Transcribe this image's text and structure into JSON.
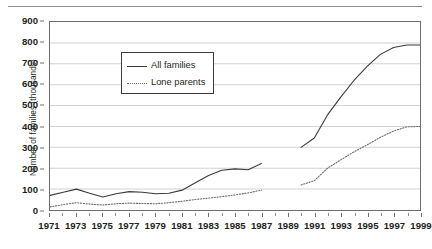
{
  "chart_data": {
    "type": "line",
    "title": "",
    "xlabel": "",
    "ylabel": "Number of families (thousands)",
    "ylim": [
      0,
      900
    ],
    "ytick_values": [
      0,
      100,
      200,
      300,
      400,
      500,
      600,
      700,
      800,
      900
    ],
    "ytick_labels": [
      "0",
      "100",
      "200",
      "300",
      "400",
      "500",
      "600",
      "700",
      "800",
      "900"
    ],
    "xlim": [
      1971,
      1999
    ],
    "xtick_values": [
      1971,
      1973,
      1975,
      1977,
      1979,
      1981,
      1983,
      1985,
      1987,
      1989,
      1991,
      1993,
      1995,
      1997,
      1999
    ],
    "xtick_labels": [
      "1971",
      "1973",
      "1975",
      "1977",
      "1979",
      "1981",
      "1983",
      "1985",
      "1987",
      "1989",
      "1991",
      "1993",
      "1995",
      "1997",
      "1999"
    ],
    "xtick_minor_values": [
      1972,
      1974,
      1976,
      1978,
      1980,
      1982,
      1984,
      1986,
      1988,
      1990,
      1992,
      1994,
      1996,
      1998
    ],
    "grid": "horizontal",
    "legend_position": "upper left",
    "series": [
      {
        "name": "All families",
        "style": "solid",
        "color": "#3b3b3b",
        "segments": [
          {
            "x": [
              1971,
              1972,
              1973,
              1974,
              1975,
              1976,
              1977,
              1978,
              1979,
              1980,
              1981,
              1982,
              1983,
              1984,
              1985,
              1986,
              1987
            ],
            "y": [
              70,
              85,
              100,
              80,
              62,
              78,
              88,
              85,
              78,
              80,
              95,
              130,
              165,
              190,
              197,
              193,
              222
            ]
          },
          {
            "x": [
              1990,
              1991,
              1992,
              1993,
              1994,
              1995,
              1996,
              1997,
              1998,
              1999
            ],
            "y": [
              300,
              345,
              455,
              540,
              620,
              688,
              745,
              778,
              790,
              790
            ]
          }
        ]
      },
      {
        "name": "Lone parents",
        "style": "dotted",
        "color": "#6b6b6b",
        "segments": [
          {
            "x": [
              1971,
              1972,
              1973,
              1974,
              1975,
              1976,
              1977,
              1978,
              1979,
              1980,
              1981,
              1982,
              1983,
              1984,
              1985,
              1986,
              1987
            ],
            "y": [
              15,
              26,
              35,
              28,
              24,
              30,
              33,
              31,
              30,
              35,
              42,
              50,
              57,
              64,
              72,
              82,
              95
            ]
          },
          {
            "x": [
              1990,
              1991,
              1992,
              1993,
              1994,
              1995,
              1996,
              1997,
              1998,
              1999
            ],
            "y": [
              120,
              140,
              200,
              240,
              278,
              312,
              348,
              378,
              398,
              400
            ]
          }
        ]
      }
    ]
  },
  "legend": {
    "items": [
      {
        "label": "All families",
        "style": "solid"
      },
      {
        "label": "Lone parents",
        "style": "dotted"
      }
    ]
  }
}
